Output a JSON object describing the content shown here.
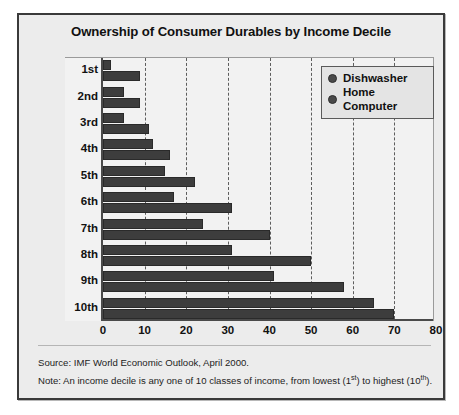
{
  "figure": {
    "title": "Ownership of Consumer Durables by Income Decile",
    "source_note": "Source: IMF World Economic Outlook, April 2000.",
    "note_prefix": "Note: An income decile is any one of 10 classes of income, from lowest (1",
    "note_sup1": "st",
    "note_mid": ") to highest (10",
    "note_sup2": "th",
    "note_suffix": ").",
    "bar_color": "#3d3d3d",
    "panel_color": "#ececec",
    "plot_color": "#f2f2f2"
  },
  "legend": {
    "items": [
      {
        "label": "Dishwasher",
        "marker": "circle-marker"
      },
      {
        "label": "Home Computer",
        "marker": "circle-marker"
      }
    ]
  },
  "chart_data": {
    "type": "bar",
    "orientation": "horizontal",
    "title": "Ownership of Consumer Durables by Income Decile",
    "xlabel": "",
    "ylabel": "",
    "xlim": [
      0,
      80
    ],
    "xticks": [
      0,
      10,
      20,
      30,
      40,
      50,
      60,
      70,
      80
    ],
    "grid": "vertical-dashed",
    "legend_position": "top-right-inside",
    "categories": [
      "1st",
      "2nd",
      "3rd",
      "4th",
      "5th",
      "6th",
      "7th",
      "8th",
      "9th",
      "10th"
    ],
    "series": [
      {
        "name": "Dishwasher",
        "values": [
          2,
          5,
          5,
          12,
          15,
          17,
          24,
          31,
          41,
          65
        ]
      },
      {
        "name": "Home Computer",
        "values": [
          9,
          9,
          11,
          16,
          22,
          31,
          40,
          50,
          58,
          70
        ]
      }
    ]
  }
}
